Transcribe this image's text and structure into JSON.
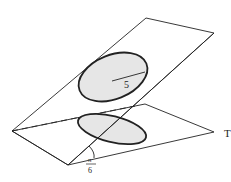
{
  "diagram": {
    "radius_label": "5",
    "angle_label_numerator": "π",
    "angle_label_denominator": "6",
    "edge_label": "T",
    "colors": {
      "stroke": "#222222",
      "fill": "#e6e6e6",
      "background": "#ffffff"
    }
  }
}
